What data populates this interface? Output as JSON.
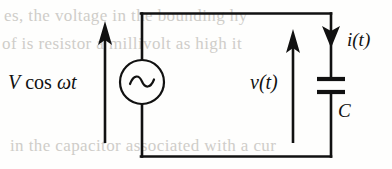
{
  "figure": {
    "type": "circuit-diagram",
    "width": 392,
    "height": 169,
    "background_color": "#fefefd",
    "line_color": "#111111"
  },
  "labels": {
    "source_V": "V",
    "source_cos": " cos ",
    "source_omega_t": "ωt",
    "source_full": "V cos ωt",
    "voltage": "v(t)",
    "current": "i(t)",
    "capacitor": "C"
  },
  "components": [
    {
      "name": "ac-voltage-source",
      "symbol": "circle-with-sine",
      "label": "V cos ωt",
      "position": {
        "cx": 142,
        "cy": 82,
        "r": 22
      }
    },
    {
      "name": "capacitor",
      "symbol": "parallel-plates",
      "label": "C",
      "position": {
        "cx": 331,
        "plate_top_y": 79,
        "plate_bottom_y": 92,
        "plate_half_width": 14
      }
    }
  ],
  "arrows": [
    {
      "name": "source-voltage-arrow",
      "direction": "up",
      "label": "V cos ωt",
      "x": 105,
      "from_y": 143,
      "to_y": 22
    },
    {
      "name": "capacitor-voltage-arrow",
      "direction": "up",
      "label": "v(t)",
      "x": 293,
      "from_y": 143,
      "to_y": 30
    },
    {
      "name": "current-arrow",
      "direction": "down",
      "label": "i(t)",
      "x": 331,
      "from_y": 18,
      "to_y": 46
    }
  ],
  "wires": {
    "top": {
      "x1": 142,
      "y1": 13,
      "x2": 331,
      "y2": 13
    },
    "bottom": {
      "x1": 142,
      "y1": 157,
      "x2": 331,
      "y2": 157
    },
    "left": {
      "x": 142,
      "y1": 13,
      "y2": 157
    },
    "right": {
      "x": 331,
      "y1": 13,
      "y2": 157
    }
  },
  "bleed_text": {
    "line1": "es, the voltage in the bounding hy",
    "line2": "of  is  resistor  a  millivolt  as  high  it",
    "line3": "in the capacitor associated with a cur"
  }
}
